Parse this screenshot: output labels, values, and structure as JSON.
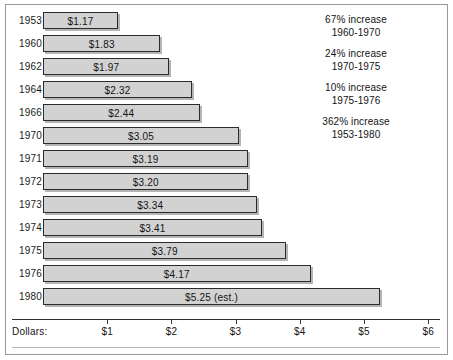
{
  "chart_data": {
    "type": "bar",
    "orientation": "horizontal",
    "title": "",
    "xlabel": "Dollars:",
    "ylabel": "",
    "xlim": [
      0,
      6.5
    ],
    "grid": false,
    "categories": [
      "1953",
      "1960",
      "1962",
      "1964",
      "1966",
      "1970",
      "1971",
      "1972",
      "1973",
      "1974",
      "1975",
      "1976",
      "1980"
    ],
    "values": [
      1.17,
      1.83,
      1.97,
      2.32,
      2.44,
      3.05,
      3.19,
      3.2,
      3.34,
      3.41,
      3.79,
      4.17,
      5.25
    ],
    "value_labels": [
      "$1.17",
      "$1.83",
      "$1.97",
      "$2.32",
      "$2.44",
      "$3.05",
      "$3.19",
      "$3.20",
      "$3.34",
      "$3.41",
      "$3.79",
      "$4.17",
      "$5.25 (est.)"
    ],
    "tick_values": [
      1,
      2,
      3,
      4,
      5,
      6
    ],
    "tick_labels": [
      "$1",
      "$2",
      "$3",
      "$4",
      "$5",
      "$6"
    ],
    "annotations": [
      {
        "line1": "67% increase",
        "line2": "1960-1970"
      },
      {
        "line1": "24% increase",
        "line2": "1970-1975"
      },
      {
        "line1": "10% increase",
        "line2": "1975-1976"
      },
      {
        "line1": "362% increase",
        "line2": "1953-1980"
      }
    ],
    "bar_fill_color": "#d2d2d2",
    "bar_border_color": "#2b2b2b",
    "text_color": "#141414"
  }
}
